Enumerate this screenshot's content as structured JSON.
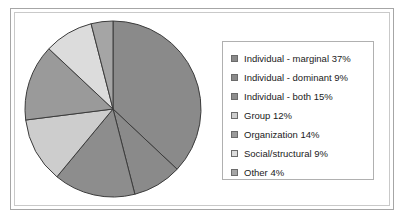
{
  "chart_data": {
    "type": "pie",
    "title": "",
    "labels": [
      "Individual - marginal",
      "Individual - dominant",
      "Individual - both",
      "Group",
      "Organization",
      "Social/structural",
      "Other"
    ],
    "values": [
      37,
      9,
      15,
      12,
      14,
      9,
      4
    ],
    "units": "percent",
    "start_angle_deg": 0,
    "direction": "clockwise",
    "legend_position": "right",
    "grid": false,
    "slice_colors": [
      "#8a8a8a",
      "#8a8a8a",
      "#8d8d8d",
      "#cdcdcd",
      "#9a9a9a",
      "#dcdcdc",
      "#a5a5a5"
    ],
    "slice_border_color": "#3c3c3c",
    "legend_entries": [
      {
        "label": "Individual - marginal 37%",
        "color": "#8a8a8a"
      },
      {
        "label": "Individual - dominant 9%",
        "color": "#8a8a8a"
      },
      {
        "label": "Individual - both 15%",
        "color": "#8d8d8d"
      },
      {
        "label": "Group 12%",
        "color": "#cdcdcd"
      },
      {
        "label": "Organization 14%",
        "color": "#9a9a9a"
      },
      {
        "label": "Social/structural 9%",
        "color": "#dcdcdc"
      },
      {
        "label": "Other 4%",
        "color": "#a5a5a5"
      }
    ]
  },
  "frame": {
    "outer_border_color": "#a6a6a6",
    "inner_border_color": "#c9c9c9",
    "background": "#ffffff"
  }
}
